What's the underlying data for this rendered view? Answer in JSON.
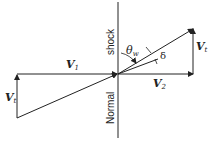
{
  "labels": {
    "v1": {
      "main": "V",
      "sub": "1"
    },
    "v2": {
      "main": "V",
      "sub": "2"
    },
    "vt_right": {
      "main": "V",
      "sub": "t"
    },
    "vt_left": {
      "main": "V",
      "sub": "t"
    },
    "theta": {
      "main": "θ",
      "sub": "w"
    },
    "delta": "δ",
    "shock": "shock",
    "normal": "Normal"
  },
  "colors": {
    "line": "#222222",
    "background": "#ffffff"
  }
}
